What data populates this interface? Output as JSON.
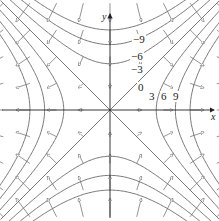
{
  "diagram": {
    "axes": {
      "x_label": "x",
      "y_label": "y"
    },
    "origin_px": [
      110,
      110
    ],
    "scale_px_per_unit": 26.7,
    "level_values": [
      -9,
      -6,
      -3,
      0,
      3,
      6,
      9
    ],
    "level_labels": [
      {
        "text": "-9",
        "x": 133,
        "y": 43
      },
      {
        "text": "-6",
        "x": 131,
        "y": 60
      },
      {
        "text": "-3",
        "x": 131,
        "y": 73
      },
      {
        "text": "0",
        "x": 138,
        "y": 91
      },
      {
        "text": "3",
        "x": 149,
        "y": 100
      },
      {
        "text": "6",
        "x": 161,
        "y": 100
      },
      {
        "text": "9",
        "x": 173,
        "y": 100
      }
    ],
    "colors": {
      "curve": "#555555",
      "axis": "#222222",
      "arrow": "#666666"
    }
  }
}
